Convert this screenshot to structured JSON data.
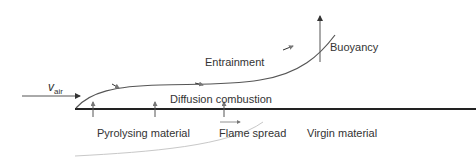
{
  "labels": {
    "v_air_main": "v",
    "v_air_sub": "air",
    "entrainment": "Entrainment",
    "buoyancy": "Buoyancy",
    "diffusion_combustion": "Diffusion combustion",
    "pyrolysing_material": "Pyrolysing material",
    "flame_spread": "Flame spread",
    "virgin_material": "Virgin material"
  },
  "colors": {
    "line": "#555555",
    "surface": "#222222",
    "faint_curve": "#bbbbbb"
  }
}
